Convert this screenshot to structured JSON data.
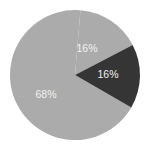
{
  "chart_data": {
    "type": "pie",
    "title": "",
    "categories": [
      "A",
      "B",
      "C"
    ],
    "values": [
      68,
      16,
      16
    ],
    "labels": [
      "68%",
      "16%",
      "16%"
    ],
    "colors": [
      "#ababab",
      "#ababab",
      "#353535"
    ],
    "label_color": "#f2f2f2",
    "legend": "none",
    "start_angle_deg": 30,
    "direction": "clockwise-from-dark-wedge-bottom"
  }
}
